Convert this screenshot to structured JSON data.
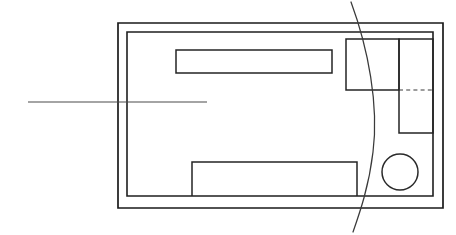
{
  "drawing": {
    "title": "Floor Plan Line Drawing",
    "canvas": {
      "width": 456,
      "height": 235,
      "background": "#ffffff"
    },
    "colors": {
      "wall_stroke": "#1a1a1a",
      "inner_stroke": "#1f1f1f",
      "fixture_stroke": "#242424",
      "dashed_stroke": "#3a3a3a",
      "curve_stroke": "#3a3a3a",
      "leader_stroke": "#4a4a4a"
    },
    "elements": {
      "outer_wall": {
        "name": "outer-wall-rectangle",
        "x": 118,
        "y": 23,
        "width": 325,
        "height": 185,
        "path": "M 118 23 L 443 23 L 443 208 L 118 208 Z"
      },
      "inner_wall": {
        "name": "inner-wall-rectangle",
        "x": 127,
        "y": 32,
        "width": 306,
        "height": 164,
        "path": "M 127 32 L 433 32 L 433 196 L 127 196 Z"
      },
      "upper_bar": {
        "name": "upper-horizontal-bar",
        "x": 176,
        "y": 50,
        "width": 156,
        "height": 23,
        "path": "M 176 50 L 332 50 L 332 73 L 176 73 Z"
      },
      "lower_bar": {
        "name": "lower-horizontal-bar",
        "x": 192,
        "y": 162,
        "width": 165,
        "height": 34,
        "path": "M 192 196 L 192 162 L 357 162 L 357 196"
      },
      "right_upper_box": {
        "name": "right-upper-box",
        "x": 346,
        "y": 39,
        "width": 53,
        "height": 51,
        "path": "M 346 39 L 399 39 L 399 90 L 346 90 Z"
      },
      "right_tall_box": {
        "name": "right-tall-box",
        "x": 399,
        "y": 39,
        "width": 34,
        "height": 94,
        "path": "M 399 39 L 433 39 L 433 133 L 399 133 Z"
      },
      "dashed_divider": {
        "name": "dashed-divider-line",
        "x1": 399,
        "y1": 90,
        "x2": 433,
        "y2": 90,
        "path": "M 399 90 L 433 90"
      },
      "circle_fixture": {
        "name": "circle-fixture",
        "cx": 400,
        "cy": 172,
        "r": 18
      },
      "arc_curve": {
        "name": "sweep-arc-curve",
        "start_x": 351,
        "start_y": 2,
        "end_x": 353,
        "end_y": 232,
        "path": "M 351 2 C 368 48 379 105 373 152 C 369 186 360 212 353 232"
      },
      "leader": {
        "name": "leader-line",
        "x1": 28,
        "y1": 102,
        "x2": 207,
        "y2": 102,
        "path": "M 28 102 L 207 102"
      }
    }
  }
}
